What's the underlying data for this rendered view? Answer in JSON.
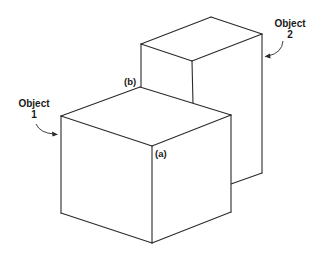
{
  "diagram": {
    "type": "isometric-blocks",
    "stroke_color": "#2a2a2a",
    "background": "#ffffff",
    "objects": [
      {
        "id": "object-1",
        "label_line1": "Object",
        "label_line2": "1",
        "description": "front cube"
      },
      {
        "id": "object-2",
        "label_line1": "Object",
        "label_line2": "2",
        "description": "taller block behind"
      }
    ],
    "vertex_labels": {
      "a": "(a)",
      "b": "(b)"
    }
  }
}
